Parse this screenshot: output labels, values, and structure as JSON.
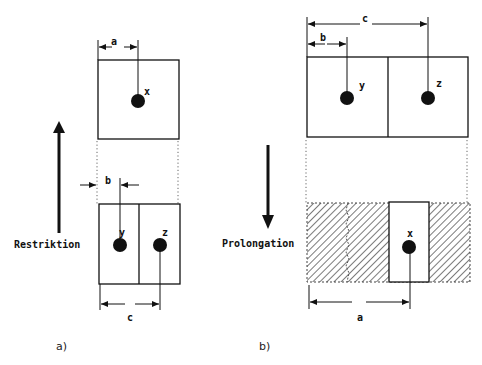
{
  "figure": {
    "panel_a": {
      "caption": "a)",
      "direction_label": "Restriktion",
      "direction": "up",
      "coarse_cell": {
        "point_label": "x",
        "dimension_label": "a"
      },
      "fine_cells": [
        {
          "point_label": "y"
        },
        {
          "point_label": "z"
        }
      ],
      "dimension_b_label": "b",
      "dimension_c_label": "c"
    },
    "panel_b": {
      "caption": "b)",
      "direction_label": "Prolongation",
      "direction": "down",
      "fine_cells": [
        {
          "point_label": "y"
        },
        {
          "point_label": "z"
        }
      ],
      "dimension_b_label": "b",
      "dimension_c_label": "c",
      "coarse_cell": {
        "point_label": "x",
        "dimension_label": "a"
      }
    },
    "colors": {
      "ink": "#111111",
      "background": "#ffffff",
      "hatch": "#333333"
    }
  }
}
